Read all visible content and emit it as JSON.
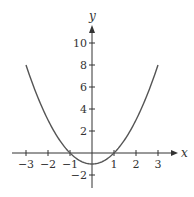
{
  "chart_data": {
    "type": "line",
    "title": "",
    "xlabel": "x",
    "ylabel": "y",
    "function": "y = x^2 - 1",
    "xlim": [
      -3,
      3
    ],
    "ylim": [
      -2,
      10
    ],
    "x_ticks": [
      -3,
      -2,
      -1,
      1,
      2,
      3
    ],
    "x_tick_labels": [
      "−3",
      "−2",
      "−1",
      "1",
      "2",
      "3"
    ],
    "y_ticks": [
      -2,
      2,
      4,
      6,
      8,
      10
    ],
    "y_tick_labels": [
      "−2",
      "2",
      "4",
      "6",
      "8",
      "10"
    ],
    "grid": false,
    "legend": null,
    "series": [
      {
        "name": "y = x^2 - 1",
        "x": [
          -3,
          -2.5,
          -2,
          -1.5,
          -1,
          -0.5,
          0,
          0.5,
          1,
          1.5,
          2,
          2.5,
          3
        ],
        "y": [
          8,
          5.25,
          3,
          1.25,
          0,
          -0.75,
          -1,
          -0.75,
          0,
          1.25,
          3,
          5.25,
          8
        ]
      }
    ],
    "colors": {
      "curve": "#555555",
      "axes": "#333333"
    }
  },
  "labels": {
    "x_axis": "x",
    "y_axis": "y"
  }
}
